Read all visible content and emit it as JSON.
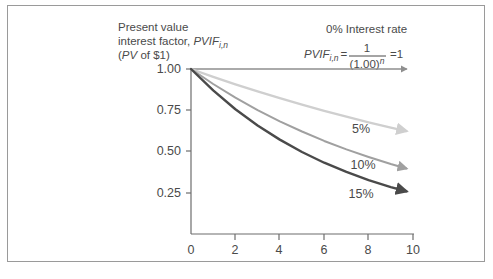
{
  "figure": {
    "yaxis_caption_line1": "Present value",
    "yaxis_caption_line2_prefix": "interest factor, ",
    "yaxis_caption_line2_symbol": "PVIF",
    "yaxis_caption_line2_sub": "i,n",
    "yaxis_caption_line3_open": "(",
    "yaxis_caption_line3_symbol": "PV",
    "yaxis_caption_line3_rest": " of $1)",
    "zero_rate_note": "0% Interest rate",
    "formula": {
      "symbol": "PVIF",
      "subscript": "i,n",
      "equals": "=",
      "numerator": "1",
      "denominator_base": "(1.00)",
      "denominator_exponent": "n",
      "result": "=1"
    }
  },
  "chart_data": {
    "type": "line",
    "xlabel": "",
    "ylabel": "",
    "xlim": [
      0,
      10
    ],
    "ylim": [
      0,
      1.05
    ],
    "grid": false,
    "legend_position": "inline-right",
    "xticks": [
      "0",
      "2",
      "4",
      "6",
      "8",
      "10"
    ],
    "xtick_values": [
      0,
      2,
      4,
      6,
      8,
      10
    ],
    "yticks": [
      "0.25",
      "0.50",
      "0.75",
      "1.00"
    ],
    "ytick_values": [
      0.25,
      0.5,
      0.75,
      1.0
    ],
    "series": [
      {
        "name": "0%",
        "label": "0% Interest rate",
        "rate": 0.0,
        "color": "#8f8f8f",
        "width": 1.3,
        "x": [
          0,
          1,
          2,
          3,
          4,
          5,
          6,
          7,
          8,
          9,
          9.7
        ],
        "values": [
          1.0,
          1.0,
          1.0,
          1.0,
          1.0,
          1.0,
          1.0,
          1.0,
          1.0,
          1.0,
          1.0
        ]
      },
      {
        "name": "5%",
        "label": "5%",
        "rate": 0.05,
        "color": "#cfcfcf",
        "width": 2.3,
        "x": [
          0,
          1,
          2,
          3,
          4,
          5,
          6,
          7,
          8,
          9,
          9.7
        ],
        "values": [
          1.0,
          0.952,
          0.907,
          0.864,
          0.823,
          0.784,
          0.746,
          0.711,
          0.677,
          0.645,
          0.624
        ]
      },
      {
        "name": "10%",
        "label": "10%",
        "rate": 0.1,
        "color": "#a0a0a0",
        "width": 2.0,
        "x": [
          0,
          1,
          2,
          3,
          4,
          5,
          6,
          7,
          8,
          9,
          9.7
        ],
        "values": [
          1.0,
          0.909,
          0.826,
          0.751,
          0.683,
          0.621,
          0.564,
          0.513,
          0.467,
          0.424,
          0.397
        ]
      },
      {
        "name": "15%",
        "label": "15%",
        "rate": 0.15,
        "color": "#4a4a4a",
        "width": 2.4,
        "x": [
          0,
          1,
          2,
          3,
          4,
          5,
          6,
          7,
          8,
          9,
          9.7
        ],
        "values": [
          1.0,
          0.87,
          0.756,
          0.658,
          0.572,
          0.497,
          0.432,
          0.376,
          0.327,
          0.284,
          0.259
        ]
      }
    ],
    "series_endpoint_labels": [
      "5%",
      "10%",
      "15%"
    ]
  }
}
